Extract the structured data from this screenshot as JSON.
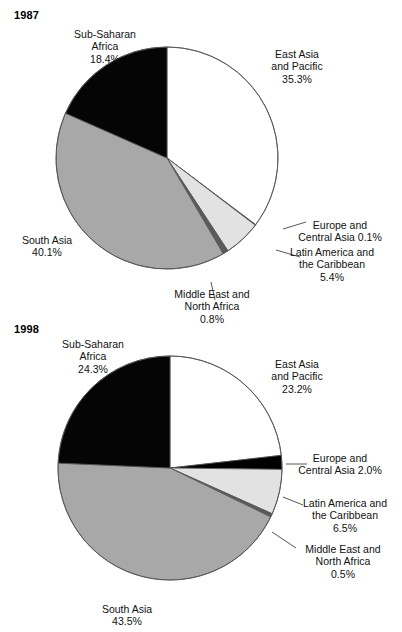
{
  "figure": {
    "background": "#ffffff",
    "text_color": "#111111"
  },
  "palette": {
    "east_asia": "#ffffff",
    "europe_central_asia": "#000000",
    "latin_america": "#e2e2e2",
    "middle_east": "#5a5a5a",
    "south_asia": "#a8a8a8",
    "sub_saharan": "#050505",
    "outline": "#555555"
  },
  "charts": [
    {
      "id": "chart-1987",
      "year": "1987",
      "labels": {
        "sub_saharan": {
          "l1": "Sub-Saharan",
          "l2": "Africa",
          "l3": "18.4%"
        },
        "east_asia": {
          "l1": "East Asia",
          "l2": "and Pacific",
          "l3": "35.3%"
        },
        "europe": {
          "l1": "Europe and",
          "l2": "Central Asia 0.1%"
        },
        "latin": {
          "l1": "Latin America and",
          "l2": "the Caribbean",
          "l3": "5.4%"
        },
        "middle_east": {
          "l1": "Middle East and",
          "l2": "North Africa",
          "l3": "0.8%"
        },
        "south_asia": {
          "l1": "South Asia",
          "l2": "40.1%"
        }
      }
    },
    {
      "id": "chart-1998",
      "year": "1998",
      "labels": {
        "sub_saharan": {
          "l1": "Sub-Saharan",
          "l2": "Africa",
          "l3": "24.3%"
        },
        "east_asia": {
          "l1": "East Asia",
          "l2": "and Pacific",
          "l3": "23.2%"
        },
        "europe": {
          "l1": "Europe and",
          "l2": "Central Asia 2.0%"
        },
        "latin": {
          "l1": "Latin America and",
          "l2": "the Caribbean",
          "l3": "6.5%"
        },
        "middle_east": {
          "l1": "Middle East and",
          "l2": "North Africa",
          "l3": "0.5%"
        },
        "south_asia": {
          "l1": "South Asia",
          "l2": "43.5%"
        }
      }
    }
  ],
  "chart_data": [
    {
      "type": "pie",
      "title": "1987",
      "xlabel": "",
      "ylabel": "",
      "start_angle_deg": 0,
      "direction": "clockwise",
      "categories": [
        "East Asia and Pacific",
        "Europe and Central Asia",
        "Latin America and the Caribbean",
        "Middle East and North Africa",
        "South Asia",
        "Sub-Saharan Africa"
      ],
      "values": [
        35.3,
        0.1,
        5.4,
        0.8,
        40.1,
        18.4
      ],
      "unit": "percent",
      "colors": [
        "#ffffff",
        "#000000",
        "#e2e2e2",
        "#5a5a5a",
        "#a8a8a8",
        "#050505"
      ],
      "legend": "labels-outside",
      "grid": false
    },
    {
      "type": "pie",
      "title": "1998",
      "xlabel": "",
      "ylabel": "",
      "start_angle_deg": 0,
      "direction": "clockwise",
      "categories": [
        "East Asia and Pacific",
        "Europe and Central Asia",
        "Latin America and the Caribbean",
        "Middle East and North Africa",
        "South Asia",
        "Sub-Saharan Africa"
      ],
      "values": [
        23.2,
        2.0,
        6.5,
        0.5,
        43.5,
        24.3
      ],
      "unit": "percent",
      "colors": [
        "#ffffff",
        "#000000",
        "#e2e2e2",
        "#5a5a5a",
        "#a8a8a8",
        "#050505"
      ],
      "legend": "labels-outside",
      "grid": false
    }
  ]
}
